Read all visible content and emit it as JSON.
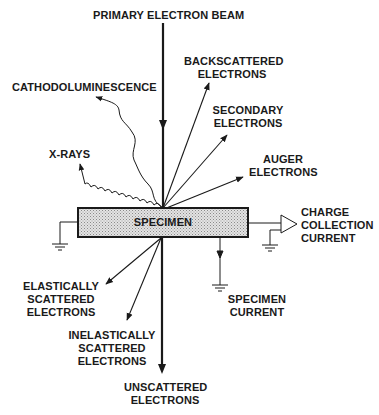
{
  "figure": {
    "colors": {
      "ink": "#1a1a1a",
      "specimen_fill": "#cfcfcf",
      "background": "#ffffff"
    },
    "specimen": {
      "label": "SPECIMEN"
    },
    "incident": {
      "label": "PRIMARY ELECTRON BEAM"
    },
    "upper_signals": [
      {
        "id": "backscattered",
        "line1": "BACKSCATTERED",
        "line2": "ELECTRONS",
        "type": "straight-arrow"
      },
      {
        "id": "secondary",
        "line1": "SECONDARY",
        "line2": "ELECTRONS",
        "type": "straight-arrow"
      },
      {
        "id": "auger",
        "line1": "AUGER",
        "line2": "ELECTRONS",
        "type": "straight-arrow"
      },
      {
        "id": "cathodoluminescence",
        "line1": "CATHODOLUMINESCENCE",
        "type": "wavy-arrow"
      },
      {
        "id": "xrays",
        "line1": "X-RAYS",
        "type": "wavy-arrow"
      }
    ],
    "lower_signals": [
      {
        "id": "elastic",
        "line1": "ELASTICALLY",
        "line2": "SCATTERED",
        "line3": "ELECTRONS"
      },
      {
        "id": "inelastic",
        "line1": "INELASTICALLY",
        "line2": "SCATTERED",
        "line3": "ELECTRONS"
      },
      {
        "id": "unscattered",
        "line1": "UNSCATTERED",
        "line2": "ELECTRONS"
      }
    ],
    "electrical": {
      "charge_collection": {
        "line1": "CHARGE",
        "line2": "COLLECTION",
        "line3": "CURRENT"
      },
      "specimen_current": {
        "line1": "SPECIMEN",
        "line2": "CURRENT"
      }
    }
  }
}
